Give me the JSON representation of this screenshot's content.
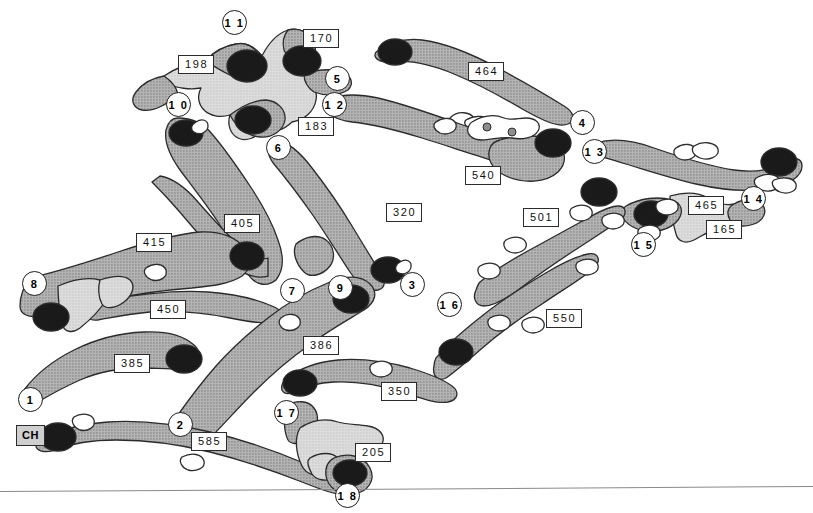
{
  "figure": {
    "background_color": "#ffffff",
    "colors": {
      "fill_medium": "#a8a8a8",
      "fill_light": "#d2d2d2",
      "blob_dark": "#1a1a1a",
      "outline": "#2b2b2b",
      "label_box_bg": "#ffffff",
      "ch_box_bg": "#cfcfcf",
      "rule": "#8a8a8a"
    }
  },
  "ch_marker": {
    "label": "CH",
    "x": 16,
    "y": 425
  },
  "segment_labels": [
    {
      "id": "170",
      "text": "170",
      "x": 303,
      "y": 29
    },
    {
      "id": "198",
      "text": "198",
      "x": 178,
      "y": 55
    },
    {
      "id": "464",
      "text": "464",
      "x": 468,
      "y": 62
    },
    {
      "id": "183",
      "text": "183",
      "x": 298,
      "y": 117
    },
    {
      "id": "540",
      "text": "540",
      "x": 465,
      "y": 166
    },
    {
      "id": "465",
      "text": "465",
      "x": 688,
      "y": 196
    },
    {
      "id": "320",
      "text": "320",
      "x": 386,
      "y": 203
    },
    {
      "id": "501",
      "text": "501",
      "x": 523,
      "y": 208
    },
    {
      "id": "165",
      "text": "165",
      "x": 706,
      "y": 220
    },
    {
      "id": "405",
      "text": "405",
      "x": 224,
      "y": 214
    },
    {
      "id": "415",
      "text": "415",
      "x": 136,
      "y": 233
    },
    {
      "id": "450",
      "text": "450",
      "x": 150,
      "y": 300
    },
    {
      "id": "550",
      "text": "550",
      "x": 546,
      "y": 309
    },
    {
      "id": "386",
      "text": "386",
      "x": 303,
      "y": 336
    },
    {
      "id": "385",
      "text": "385",
      "x": 114,
      "y": 354
    },
    {
      "id": "350",
      "text": "350",
      "x": 381,
      "y": 382
    },
    {
      "id": "585",
      "text": "585",
      "x": 191,
      "y": 432
    },
    {
      "id": "205",
      "text": "205",
      "x": 355,
      "y": 443
    }
  ],
  "nodes": [
    {
      "id": "1",
      "label": "1",
      "x": 18,
      "y": 387
    },
    {
      "id": "2",
      "label": "2",
      "x": 168,
      "y": 412
    },
    {
      "id": "3",
      "label": "3",
      "x": 400,
      "y": 272
    },
    {
      "id": "4",
      "label": "4",
      "x": 570,
      "y": 110
    },
    {
      "id": "5",
      "label": "5",
      "x": 325,
      "y": 66
    },
    {
      "id": "6",
      "label": "6",
      "x": 266,
      "y": 135
    },
    {
      "id": "7",
      "label": "7",
      "x": 280,
      "y": 278
    },
    {
      "id": "8",
      "label": "8",
      "x": 22,
      "y": 271
    },
    {
      "id": "9",
      "label": "9",
      "x": 328,
      "y": 275
    },
    {
      "id": "10",
      "label": "1 0",
      "x": 166,
      "y": 92
    },
    {
      "id": "11",
      "label": "1 1",
      "x": 222,
      "y": 10
    },
    {
      "id": "12",
      "label": "1 2",
      "x": 322,
      "y": 92
    },
    {
      "id": "13",
      "label": "1 3",
      "x": 582,
      "y": 139
    },
    {
      "id": "14",
      "label": "1 4",
      "x": 741,
      "y": 186
    },
    {
      "id": "15",
      "label": "1 5",
      "x": 631,
      "y": 232
    },
    {
      "id": "16",
      "label": "1 6",
      "x": 437,
      "y": 292
    },
    {
      "id": "17",
      "label": "1 7",
      "x": 274,
      "y": 400
    },
    {
      "id": "18",
      "label": "1 8",
      "x": 335,
      "y": 483
    }
  ]
}
